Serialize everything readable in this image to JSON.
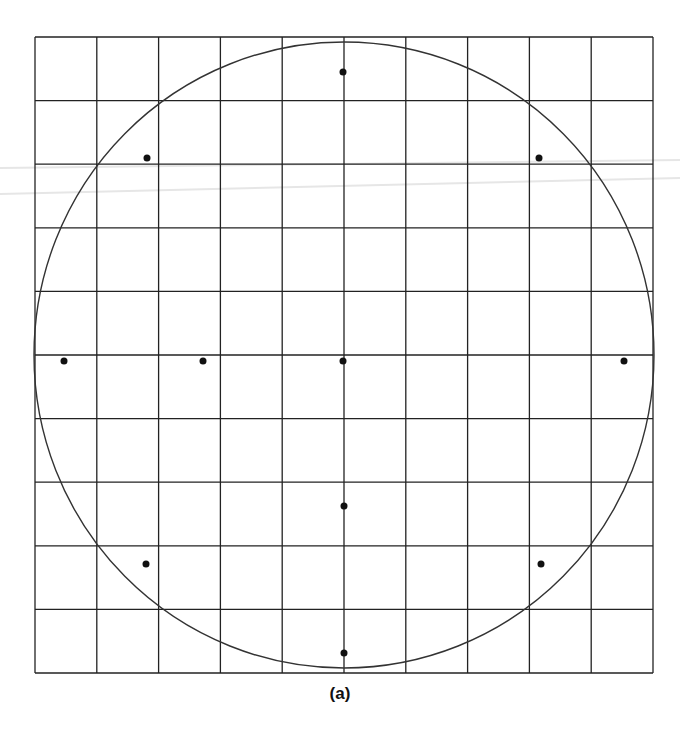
{
  "figure": {
    "caption": "(a)",
    "colors": {
      "grid": "#222222",
      "circle": "#333333",
      "point": "#111111",
      "scan_artifact": "#e6e6e6"
    },
    "grid": {
      "left": 35,
      "top": 37,
      "right": 653,
      "bottom": 673,
      "columns": 10,
      "rows": 10
    },
    "circle": {
      "cx": 344,
      "cy": 355,
      "rx": 310,
      "ry": 313
    },
    "points": [
      {
        "name": "top",
        "x": 343,
        "y": 72
      },
      {
        "name": "upper-left",
        "x": 147,
        "y": 158
      },
      {
        "name": "upper-right",
        "x": 539,
        "y": 158
      },
      {
        "name": "far-left",
        "x": 64,
        "y": 361
      },
      {
        "name": "inner-left",
        "x": 203,
        "y": 361
      },
      {
        "name": "center",
        "x": 343,
        "y": 361
      },
      {
        "name": "far-right",
        "x": 624,
        "y": 361
      },
      {
        "name": "lower-center",
        "x": 344,
        "y": 506
      },
      {
        "name": "lower-left",
        "x": 146,
        "y": 564
      },
      {
        "name": "lower-right",
        "x": 541,
        "y": 564
      },
      {
        "name": "bottom",
        "x": 344,
        "y": 653
      }
    ]
  }
}
